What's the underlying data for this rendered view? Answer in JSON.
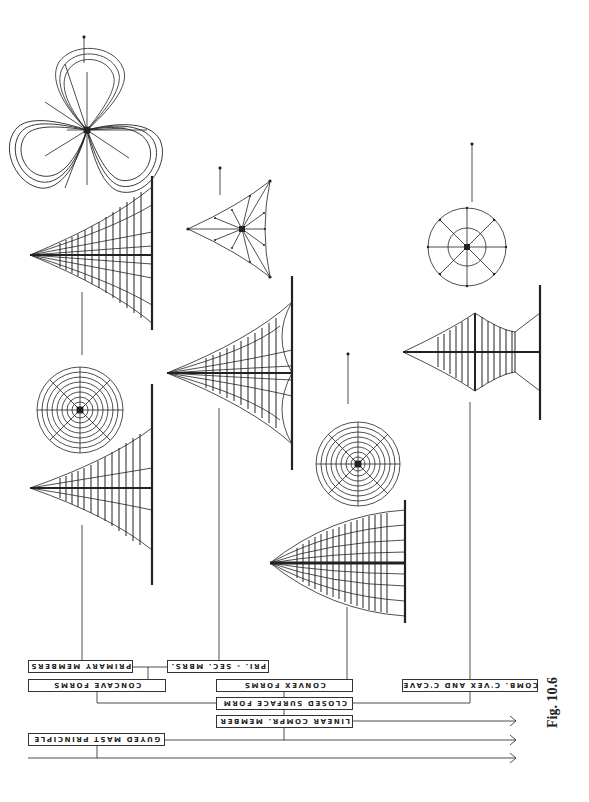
{
  "figure": {
    "caption": "Fig. 10.6",
    "orientation": "rotated 180 degrees (labels appear upside down)"
  },
  "labels": {
    "primary_members": "PRIMARY MEMBERS",
    "pri_sec_mbrs": "PRI. - SEC. MBRS.",
    "concave_forms": "CONCAVE FORMS",
    "convex_forms": "CONVEX  FORMS",
    "comb_cvex_ccave": "COMB. C'VEX AND C'CAVE",
    "closed_surface_form": "CLOSED SURFACE FORM",
    "linear_compr_member": "LINEAR COMPR. MEMBER",
    "guyed_mast_principle": "GUYED MAST PRINCIPLE"
  },
  "drawings": [
    {
      "id": "trefoil-plan",
      "type": "plan view, three-lobed"
    },
    {
      "id": "concave-mast-elevation-1",
      "type": "elevation, concave guyed mast"
    },
    {
      "id": "triangular-plan",
      "type": "plan view, triangular"
    },
    {
      "id": "concave-mast-elevation-2",
      "type": "elevation, primary-secondary members"
    },
    {
      "id": "circular-plan-concentric-1",
      "type": "plan view, concentric rings"
    },
    {
      "id": "concave-mast-elevation-3",
      "type": "elevation, concave forms"
    },
    {
      "id": "circular-plan-concentric-2",
      "type": "plan view, concentric rings"
    },
    {
      "id": "convex-mast-elevation",
      "type": "elevation, convex forms"
    },
    {
      "id": "circular-plan-two-ring",
      "type": "plan view, two rings"
    },
    {
      "id": "combined-mast-elevation",
      "type": "elevation, combined convex and concave"
    }
  ],
  "arrows": {
    "count": 3
  }
}
